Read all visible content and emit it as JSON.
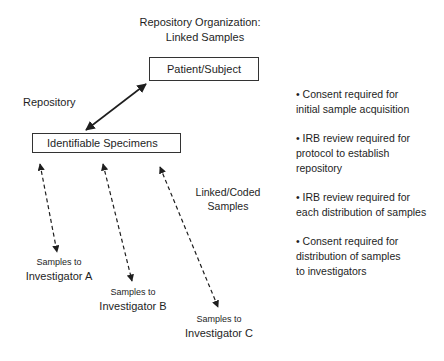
{
  "diagram": {
    "title_line1": "Repository Organization:",
    "title_line2": "Linked Samples",
    "nodes": {
      "patient": "Patient/Subject",
      "specimens": "Identifiable Specimens"
    },
    "labels": {
      "repository": "Repository",
      "linked_coded_line1": "Linked/Coded",
      "linked_coded_line2": "Samples"
    },
    "investigators": [
      {
        "line1": "Samples to",
        "line2": "Investigator A"
      },
      {
        "line1": "Samples to",
        "line2": "Investigator B"
      },
      {
        "line1": "Samples to",
        "line2": "Investigator C"
      }
    ],
    "edges": [
      {
        "from": "Identifiable Specimens",
        "to": "Patient/Subject",
        "style": "solid",
        "direction": "both"
      },
      {
        "from": "Identifiable Specimens",
        "to": "Investigator A",
        "style": "dashed",
        "direction": "both"
      },
      {
        "from": "Identifiable Specimens",
        "to": "Investigator B",
        "style": "dashed",
        "direction": "both"
      },
      {
        "from": "Identifiable Specimens",
        "to": "Investigator C",
        "style": "dashed",
        "direction": "both"
      }
    ],
    "bullets": [
      {
        "line1": "• Consent required for",
        "line2": "initial sample acquisition",
        "line3": ""
      },
      {
        "line1": "• IRB review required for",
        "line2": "protocol to establish",
        "line3": "repository"
      },
      {
        "line1": "• IRB review required for",
        "line2": "each distribution of samples",
        "line3": ""
      },
      {
        "line1": "• Consent required for",
        "line2": "distribution of samples",
        "line3": "to investigators"
      }
    ],
    "colors": {
      "line": "#1e1e1e",
      "background": "#ffffff"
    }
  }
}
